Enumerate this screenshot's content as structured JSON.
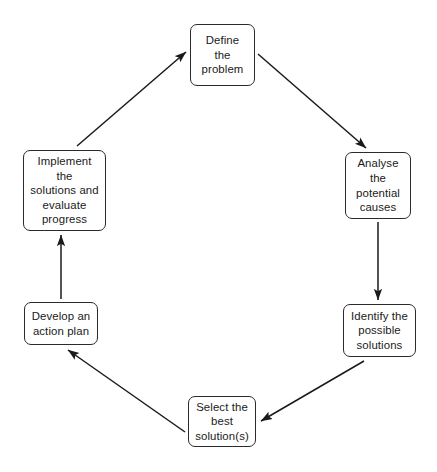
{
  "diagram": {
    "background_color": "#ffffff",
    "box_border_color": "#2b2b2b",
    "arrow_color": "#1a1a1a",
    "nodes": [
      {
        "id": "define",
        "label": "Define\nthe\nproblem"
      },
      {
        "id": "analyse",
        "label": "Analyse\nthe\npotential\ncauses"
      },
      {
        "id": "identify",
        "label": "Identify the\npossible\nsolutions"
      },
      {
        "id": "select",
        "label": "Select the\nbest\nsolution(s)"
      },
      {
        "id": "develop",
        "label": "Develop an\naction plan"
      },
      {
        "id": "implement",
        "label": "Implement\nthe\nsolutions and\nevaluate\nprogress"
      }
    ],
    "arrows": [
      {
        "id": "define-to-analyse",
        "from": "define",
        "to": "analyse",
        "direction": "down-right"
      },
      {
        "id": "analyse-to-identify",
        "from": "analyse",
        "to": "identify",
        "direction": "down"
      },
      {
        "id": "identify-to-select",
        "from": "identify",
        "to": "select",
        "direction": "down-left"
      },
      {
        "id": "select-to-develop",
        "from": "select",
        "to": "develop",
        "direction": "up-left"
      },
      {
        "id": "develop-to-implement",
        "from": "develop",
        "to": "implement",
        "direction": "up"
      },
      {
        "id": "implement-to-define",
        "from": "implement",
        "to": "define",
        "direction": "up-right"
      }
    ]
  }
}
